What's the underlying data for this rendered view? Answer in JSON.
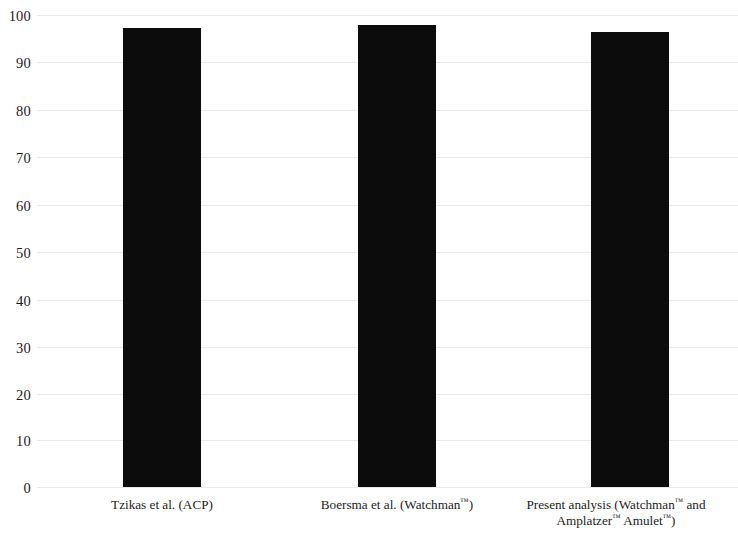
{
  "chart_data": {
    "type": "bar",
    "title": "",
    "subtitle": "",
    "xlabel": "",
    "ylabel": "",
    "categories": [
      "Tzikas et al. (ACP)",
      "Boersma et al. (Watchman™)",
      "Present analysis (Watchman™ and Amplatzer™ Amulet™)"
    ],
    "values": [
      97.3,
      97.8,
      96.3
    ],
    "ylim": [
      0,
      100
    ],
    "ytick_labels": [
      "100",
      "90",
      "80",
      "70",
      "60",
      "50",
      "40",
      "30",
      "20",
      "10",
      "0"
    ],
    "ytick_values": [
      100,
      90,
      80,
      70,
      60,
      50,
      40,
      30,
      20,
      10,
      0
    ],
    "grid": true,
    "legend": false,
    "legend_position": "none",
    "bar_color": "#0c0c0c",
    "gridline_color": "#e9e9e9",
    "background_color": "#ffffff"
  },
  "axes": {
    "y": {
      "ticks": [
        {
          "label": "100",
          "value": 100
        },
        {
          "label": "90",
          "value": 90
        },
        {
          "label": "80",
          "value": 80
        },
        {
          "label": "70",
          "value": 70
        },
        {
          "label": "60",
          "value": 60
        },
        {
          "label": "50",
          "value": 50
        },
        {
          "label": "40",
          "value": 40
        },
        {
          "label": "30",
          "value": 30
        },
        {
          "label": "20",
          "value": 20
        },
        {
          "label": "10",
          "value": 10
        },
        {
          "label": "0",
          "value": 0
        }
      ]
    },
    "x": {
      "ticks": [
        {
          "line1": "Tzikas et al. (ACP)",
          "line2": ""
        },
        {
          "line1_pre": "Boersma et al. (Watchman",
          "line1_sup": "™",
          "line1_post": ")",
          "line2": ""
        },
        {
          "line1_pre": "Present analysis (Watchman",
          "line1_sup": "™",
          "line1_post": " and",
          "line2_pre": "Amplatzer",
          "line2_sup1": "™",
          "line2_mid": " Amulet",
          "line2_sup2": "™",
          "line2_post": ")"
        }
      ]
    }
  },
  "bars": [
    {
      "label": "Tzikas et al. (ACP)",
      "value": 97.3
    },
    {
      "label": "Boersma et al. (Watchman™)",
      "value": 97.8
    },
    {
      "label": "Present analysis (Watchman™ and Amplatzer™ Amulet™)",
      "value": 96.3
    }
  ]
}
